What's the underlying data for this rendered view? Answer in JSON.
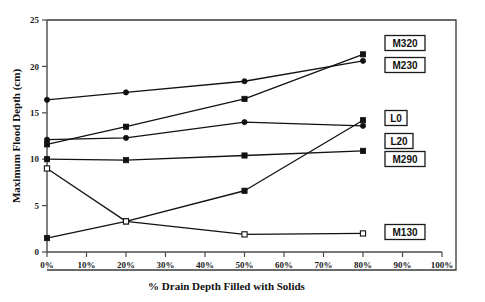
{
  "chart_data": {
    "type": "line",
    "title": "",
    "xlabel": "% Drain Depth Filled with Solids",
    "ylabel": "Maximum Flood Depth (cm)",
    "xlim": [
      0,
      100
    ],
    "ylim": [
      0,
      25
    ],
    "grid": false,
    "legend_position": "right-inline-boxed-labels",
    "x_tick_labels": [
      "0%",
      "10%",
      "20%",
      "30%",
      "40%",
      "50%",
      "60%",
      "70%",
      "80%",
      "90%",
      "100%"
    ],
    "x_tick_values": [
      0,
      10,
      20,
      30,
      40,
      50,
      60,
      70,
      80,
      90,
      100
    ],
    "y_tick_labels": [
      "0",
      "5",
      "10",
      "15",
      "20",
      "25"
    ],
    "y_tick_values": [
      0,
      5,
      10,
      15,
      20,
      25
    ],
    "x": [
      0,
      20,
      50,
      80
    ],
    "series": [
      {
        "name": "M320",
        "marker": "square",
        "values": [
          11.6,
          13.5,
          16.5,
          21.3
        ],
        "label_text": "M320"
      },
      {
        "name": "M230",
        "marker": "circle",
        "values": [
          16.4,
          17.2,
          18.4,
          20.6
        ],
        "label_text": "M230"
      },
      {
        "name": "L0",
        "marker": "square",
        "values": [
          1.5,
          3.3,
          6.6,
          14.2
        ],
        "label_text": "L0"
      },
      {
        "name": "L20",
        "marker": "circle",
        "values": [
          12.1,
          12.3,
          14.0,
          13.6
        ],
        "label_text": "L20"
      },
      {
        "name": "M290",
        "marker": "square",
        "values": [
          10.0,
          9.9,
          10.4,
          10.9
        ],
        "label_text": "M290"
      },
      {
        "name": "M130",
        "marker": "open-square",
        "values": [
          9.0,
          3.3,
          1.9,
          2.0
        ],
        "label_text": "M130"
      }
    ],
    "colors": {
      "line": "#111111",
      "axis": "#4a4a4a",
      "text": "#111111",
      "background": "#ffffff"
    }
  }
}
